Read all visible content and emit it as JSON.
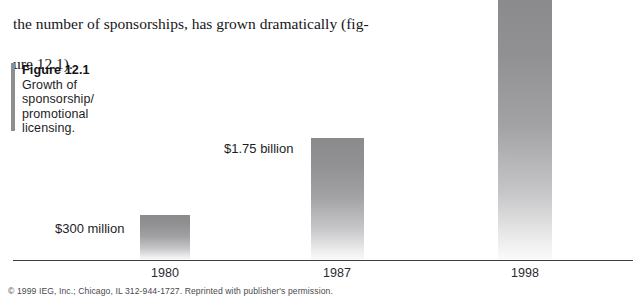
{
  "body_text": {
    "line1": "the number of sponsorships, has grown dramatically (fig-",
    "line2": "ure 12.1)."
  },
  "caption": {
    "title": "Figure 12.1",
    "subtitle": "Growth of sponsorship/ promotional licensing."
  },
  "credit": "© 1999 IEG, Inc.; Chicago, IL 312-944-1727. Reprinted with publisher's permission.",
  "chart_data": {
    "type": "bar",
    "title": "Growth of sponsorship/ promotional licensing.",
    "xlabel": "",
    "ylabel": "",
    "categories": [
      "1980",
      "1987",
      "1998"
    ],
    "values": [
      0.3,
      1.75,
      6.8
    ],
    "value_labels": [
      "$300 million",
      "$1.75 billion",
      ""
    ],
    "units": "billions of US dollars",
    "grid": false,
    "legend": "none",
    "axis_baseline_only": true,
    "bar_color_top": "#8b8b8d",
    "bar_color_bottom": "#fbfbfb",
    "axis_color": "#3f3f42"
  }
}
